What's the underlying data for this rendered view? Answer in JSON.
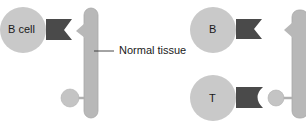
{
  "colors": {
    "cell_fill": "#c9c9c9",
    "receptor_fill": "#4a4a4a",
    "tissue_fill": "#b8b8b8",
    "tissue_stroke": "#a8a8a8",
    "text": "#1a1a1a",
    "background": "#ffffff"
  },
  "left_panel": {
    "cell_label": "B cell",
    "tissue_label": "Normal tissue",
    "elements": [
      "b-cell",
      "b-cell-receptor",
      "self-antigen-triangle",
      "normal-tissue-bar",
      "self-antigen-lollipop"
    ]
  },
  "right_panel": {
    "b_cell_label": "B",
    "t_cell_label": "T",
    "elements": [
      "b-cell",
      "b-cell-receptor",
      "t-cell",
      "t-cell-receptor",
      "antigen-triangle",
      "tissue-bar",
      "antigen-lollipop"
    ]
  }
}
